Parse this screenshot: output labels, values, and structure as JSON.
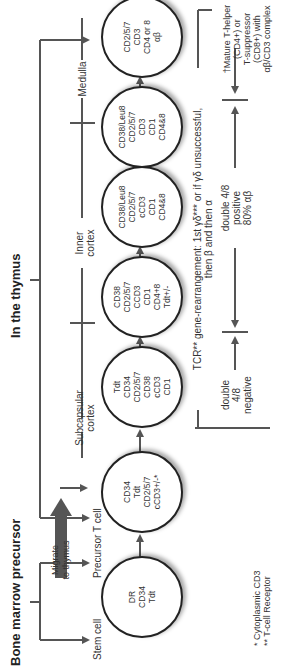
{
  "headers": {
    "bone_marrow": "Bone marrow precursor",
    "thymus": "In the thymus"
  },
  "migrate_label": [
    "Migrate",
    "to thymus"
  ],
  "stages": [
    {
      "label": "Stem cell",
      "markers": [
        "DR",
        "CD34",
        "Tdt"
      ]
    },
    {
      "label": "Precursor T cell",
      "markers": [
        "CD34",
        "Tdt",
        "CD2/5/7",
        "cCD3+/-*"
      ]
    },
    {
      "label": "",
      "markers": [
        "Tdt",
        "CD34",
        "CD2/5/7",
        "CD38",
        "cCD3",
        "CD1"
      ]
    },
    {
      "label": "",
      "markers": [
        "CD38",
        "CD2/5/7",
        "CCD3",
        "CD1",
        "CD4+8",
        "Tdt+/-"
      ]
    },
    {
      "label": "",
      "markers": [
        "CD38/Leu8",
        "CD2/5/7",
        "cCD3",
        "CD1",
        "CD4&8"
      ]
    },
    {
      "label": "",
      "markers": [
        "CD38/Leu8",
        "CD2/5/7",
        "CD3",
        "CD1",
        "CD4&8"
      ]
    },
    {
      "label": "",
      "markers": [
        "CD2/5/7",
        "CD3",
        "CD4 or 8",
        "αβ"
      ]
    }
  ],
  "regions": {
    "subcapsular": [
      "Subcapsular",
      "cortex"
    ],
    "inner": [
      "Inner",
      "cortex"
    ],
    "medulla": "Medulla"
  },
  "tcr_note": {
    "line1": "TCR** gene-rearrangement: 1st γδ*** or if γδ unsuccessful,",
    "line2": "then β and then α"
  },
  "phases": {
    "double_negative": [
      "double",
      "4/8",
      "negative"
    ],
    "double_positive": [
      "double 4/8",
      "positive",
      "80% αβ"
    ],
    "mature": [
      "†Mature T-helper",
      "(CD4+) or",
      "T-suppressor",
      "(CD8+) with",
      "αβ/CD3 complex"
    ]
  },
  "footnotes": [
    "*  Cytoplasmic CD3",
    "** T-cell Receptor"
  ],
  "colors": {
    "line": "#555555",
    "circle_border": "#222222",
    "text": "#333333"
  }
}
